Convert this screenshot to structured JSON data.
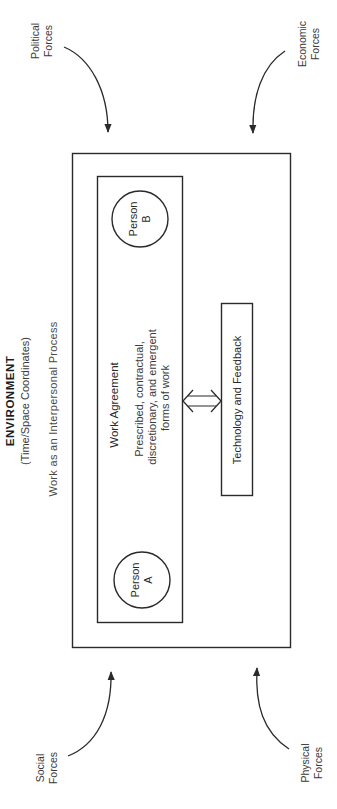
{
  "environment": {
    "title": "ENVIRONMENT",
    "subtitle": "(Time/Space Coordinates)",
    "process_label": "Work as an Interpersonal Process"
  },
  "work_agreement": {
    "title": "Work Agreement",
    "description_lines": [
      "Prescribed, contractual,",
      "discretionary, and emergent",
      "forms of work"
    ]
  },
  "persons": [
    {
      "line1": "Person",
      "line2": "A"
    },
    {
      "line1": "Person",
      "line2": "B"
    }
  ],
  "technology": {
    "label": "Technology and Feedback"
  },
  "forces": {
    "political": {
      "line1": "Political",
      "line2": "Forces"
    },
    "economic": {
      "line1": "Economic",
      "line2": "Forces"
    },
    "social": {
      "line1": "Social",
      "line2": "Forces"
    },
    "physical": {
      "line1": "Physical",
      "line2": "Forces"
    }
  },
  "colors": {
    "line": "#2a2a2a",
    "background": "#ffffff"
  }
}
